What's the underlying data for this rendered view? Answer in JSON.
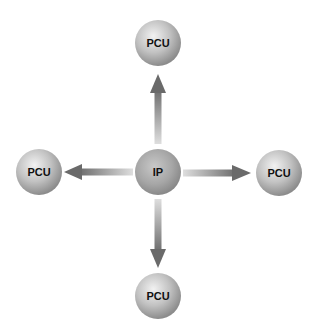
{
  "diagram": {
    "type": "star topology",
    "center_node": {
      "label": "IP"
    },
    "outer_nodes": [
      {
        "position": "top",
        "label": "PCU"
      },
      {
        "position": "left",
        "label": "PCU"
      },
      {
        "position": "right",
        "label": "PCU"
      },
      {
        "position": "bottom",
        "label": "PCU"
      }
    ],
    "edges": [
      {
        "from": "IP",
        "to": "top",
        "direction": "outward"
      },
      {
        "from": "IP",
        "to": "left",
        "direction": "outward"
      },
      {
        "from": "IP",
        "to": "right",
        "direction": "outward"
      },
      {
        "from": "IP",
        "to": "bottom",
        "direction": "outward"
      }
    ],
    "colors": {
      "background": "#ffffff",
      "sphere_light": "#eeeeee",
      "sphere_mid": "#b4b4b4",
      "sphere_dark": "#8a8a8a",
      "arrow_dark": "#6e6e6e",
      "arrow_light": "#d4d4d4",
      "label": "#111111"
    }
  }
}
